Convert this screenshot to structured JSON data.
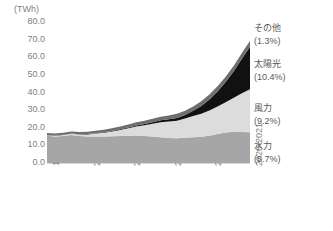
{
  "chart_data": {
    "type": "area",
    "title": "",
    "subtitle": "",
    "xlabel": "",
    "ylabel": "(TWh)",
    "unit": "(TWh)",
    "stacked": true,
    "grid": true,
    "legend_position": "right-inline",
    "ylim": [
      0.0,
      80.0
    ],
    "yticks": [
      "0.0",
      "10.0",
      "20.0",
      "30.0",
      "40.0",
      "50.0",
      "60.0",
      "70.0",
      "80.0"
    ],
    "ytick_values": [
      0.0,
      10.0,
      20.0,
      30.0,
      40.0,
      50.0,
      60.0,
      70.0,
      80.0
    ],
    "xticks": [
      "1995-1996",
      "2000-2001",
      "2005-2006",
      "2010-2011",
      "2015-2016",
      "2020-2021"
    ],
    "x": [
      "1995-1996",
      "1996-1997",
      "1997-1998",
      "1998-1999",
      "1999-2000",
      "2000-2001",
      "2001-2002",
      "2002-2003",
      "2003-2004",
      "2004-2005",
      "2005-2006",
      "2006-2007",
      "2007-2008",
      "2008-2009",
      "2009-2010",
      "2010-2011",
      "2011-2012",
      "2012-2013",
      "2013-2014",
      "2014-2015",
      "2015-2016",
      "2016-2017",
      "2017-2018",
      "2018-2019",
      "2019-2020",
      "2020-2021"
    ],
    "series": [
      {
        "name": "水力",
        "percent": "(5.7%)",
        "color": "#a6a6a6",
        "values": [
          15.4,
          15.0,
          15.3,
          15.9,
          15.3,
          15.0,
          15.1,
          15.0,
          15.2,
          15.3,
          15.5,
          15.6,
          15.3,
          15.0,
          14.6,
          14.2,
          14.0,
          14.3,
          14.6,
          14.9,
          15.5,
          16.4,
          17.3,
          17.7,
          17.6,
          17.4
        ]
      },
      {
        "name": "風力",
        "percent": "(9.2%)",
        "color": "#dcdcdc",
        "values": [
          0.4,
          0.5,
          0.6,
          0.7,
          0.9,
          1.2,
          1.6,
          2.1,
          2.7,
          3.4,
          4.2,
          5.1,
          6.1,
          7.2,
          8.5,
          9.3,
          10.0,
          10.9,
          12.0,
          13.1,
          14.3,
          15.6,
          17.2,
          19.3,
          22.0,
          24.5
        ]
      },
      {
        "name": "太陽光",
        "percent": "(10.4%)",
        "color": "#111111",
        "values": [
          0.1,
          0.1,
          0.1,
          0.1,
          0.1,
          0.2,
          0.2,
          0.3,
          0.3,
          0.4,
          0.5,
          0.6,
          0.7,
          0.9,
          1.1,
          1.3,
          1.6,
          2.1,
          3.0,
          4.4,
          6.2,
          8.5,
          11.4,
          15.0,
          19.5,
          24.0
        ]
      },
      {
        "name": "その他",
        "percent": "(1.3%)",
        "color": "#6e6e6e",
        "values": [
          1.1,
          1.1,
          1.2,
          1.2,
          1.3,
          1.3,
          1.4,
          1.4,
          1.5,
          1.6,
          1.7,
          1.8,
          1.9,
          2.0,
          2.1,
          2.2,
          2.3,
          2.4,
          2.5,
          2.7,
          2.9,
          3.0,
          3.1,
          3.2,
          3.3,
          3.4
        ]
      }
    ]
  },
  "axis": {
    "unit_label": "(TWh)"
  }
}
